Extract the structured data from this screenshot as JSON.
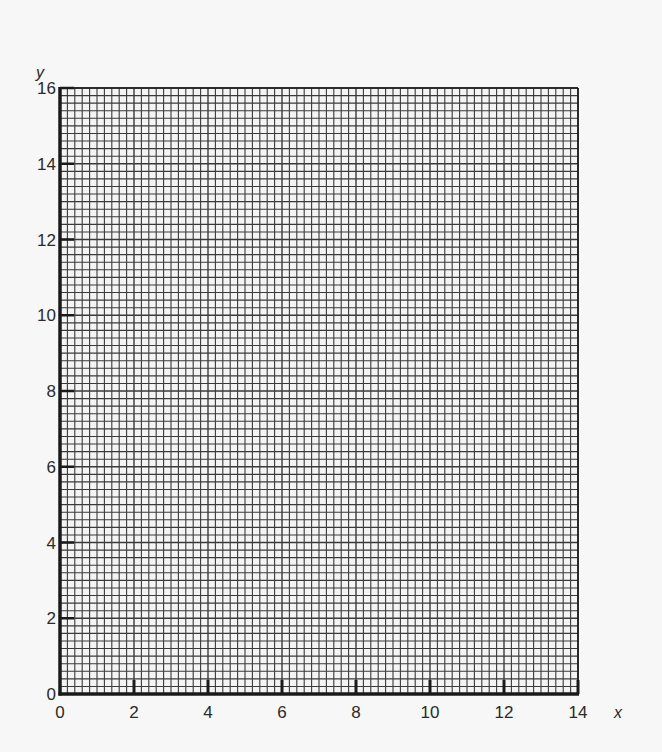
{
  "chart_data": {
    "type": "scatter",
    "title": "",
    "xlabel": "x",
    "ylabel": "y",
    "xlim": [
      0,
      14
    ],
    "ylim": [
      0,
      16
    ],
    "x_ticks": [
      0,
      2,
      4,
      6,
      8,
      10,
      12,
      14
    ],
    "y_ticks": [
      0,
      2,
      4,
      6,
      8,
      10,
      12,
      14,
      16
    ],
    "grid": true,
    "grid_minor_per_unit": 5,
    "series": [],
    "legend": null,
    "note": "Blank graph paper with labeled axes; no data plotted"
  },
  "colors": {
    "background": "#f7f7f7",
    "grid": "#3a3a3a",
    "axis": "#1a1a1a",
    "paper": "#f4f4f4"
  }
}
